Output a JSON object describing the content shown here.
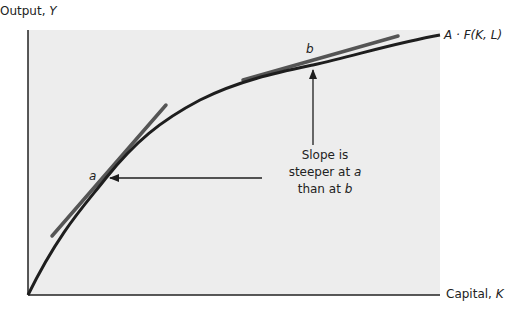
{
  "axes": {
    "y_label": "Output, ",
    "y_var": "Y",
    "x_label": "Capital, ",
    "x_var": "K"
  },
  "curve": {
    "label": "A · F(K, L)"
  },
  "points": {
    "a": "a",
    "b": "b"
  },
  "annotation": {
    "line1": "Slope is",
    "line2_text": "steeper at ",
    "line2_var": "a",
    "line3_text": "than at ",
    "line3_var": "b"
  },
  "colors": {
    "panel": "#ededed",
    "curve": "#1e1e1e",
    "tangent": "#555555",
    "axis": "#222222"
  }
}
